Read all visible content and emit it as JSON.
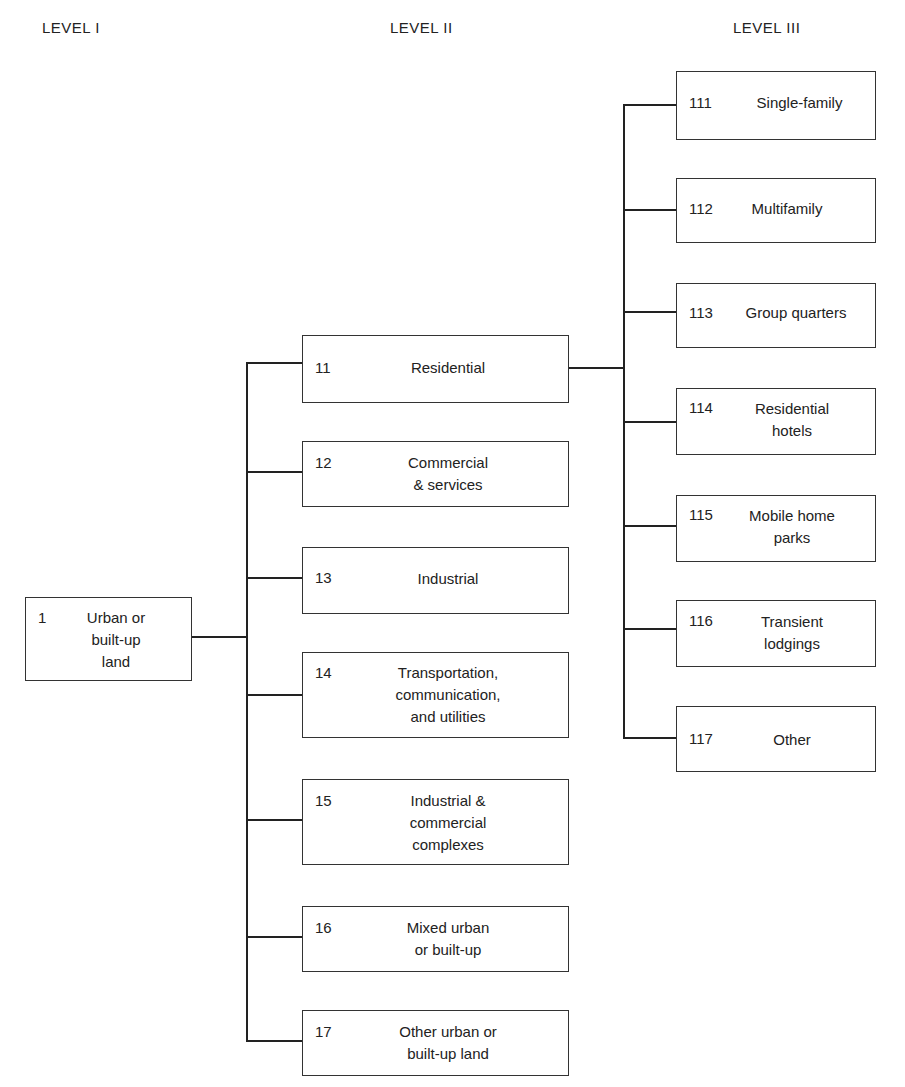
{
  "headers": {
    "level1": "LEVEL I",
    "level2": "LEVEL II",
    "level3": "LEVEL III"
  },
  "level1": {
    "code": "1",
    "label_lines": [
      "Urban or",
      "built-up",
      "land"
    ]
  },
  "level2": [
    {
      "code": "11",
      "label_lines": [
        "Residential"
      ]
    },
    {
      "code": "12",
      "label_lines": [
        "Commercial",
        "& services"
      ]
    },
    {
      "code": "13",
      "label_lines": [
        "Industrial"
      ]
    },
    {
      "code": "14",
      "label_lines": [
        "Transportation,",
        "communication,",
        "and utilities"
      ]
    },
    {
      "code": "15",
      "label_lines": [
        "Industrial &",
        "commercial",
        "complexes"
      ]
    },
    {
      "code": "16",
      "label_lines": [
        "Mixed urban",
        "or built-up"
      ]
    },
    {
      "code": "17",
      "label_lines": [
        "Other urban or",
        "built-up land"
      ]
    }
  ],
  "level3": [
    {
      "code": "111",
      "label_lines": [
        "Single-family"
      ]
    },
    {
      "code": "112",
      "label_lines": [
        "Multifamily"
      ]
    },
    {
      "code": "113",
      "label_lines": [
        "Group quarters"
      ]
    },
    {
      "code": "114",
      "label_lines": [
        "Residential",
        "hotels"
      ]
    },
    {
      "code": "115",
      "label_lines": [
        "Mobile home",
        "parks"
      ]
    },
    {
      "code": "116",
      "label_lines": [
        "Transient",
        "lodgings"
      ]
    },
    {
      "code": "117",
      "label_lines": [
        "Other"
      ]
    }
  ],
  "colors": {
    "line": "#222222",
    "border": "#333333",
    "background": "#ffffff"
  }
}
